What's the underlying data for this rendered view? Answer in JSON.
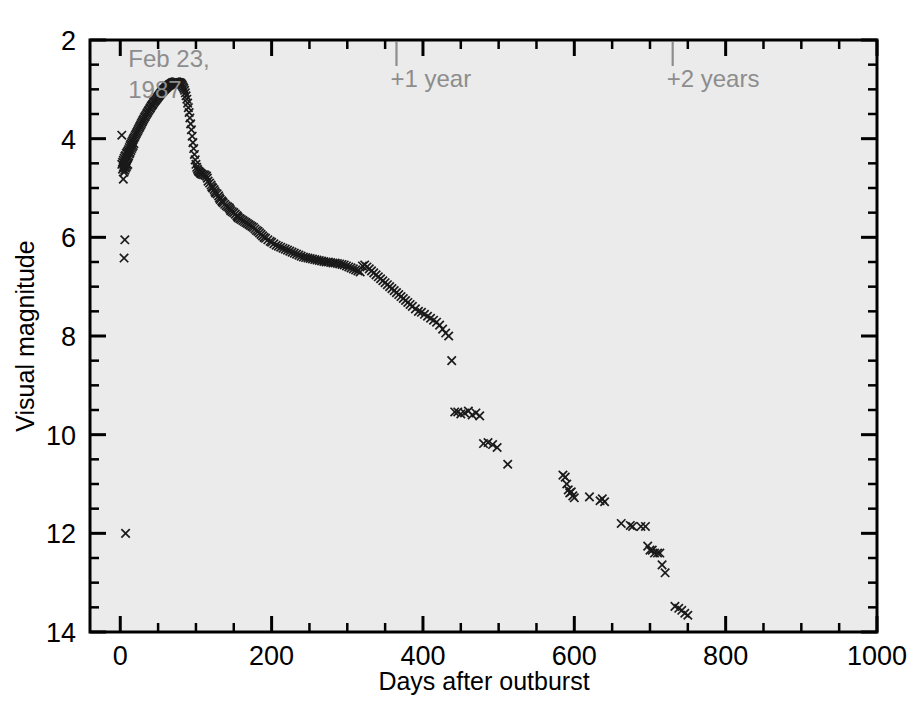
{
  "chart_data": {
    "type": "scatter",
    "title": "",
    "xlabel": "Days after outburst",
    "ylabel": "Visual magnitude",
    "xlim": [
      -40,
      1000
    ],
    "ylim": [
      2,
      14
    ],
    "y_inverted": true,
    "grid": false,
    "legend": null,
    "x_ticks_major": [
      0,
      200,
      400,
      600,
      800,
      1000
    ],
    "x_tick_labels": [
      "0",
      "200",
      "400",
      "600",
      "800",
      "1000"
    ],
    "x_ticks_minor_step": 50,
    "y_ticks_major": [
      2,
      4,
      6,
      8,
      10,
      12,
      14
    ],
    "y_tick_labels": [
      "2",
      "4",
      "6",
      "8",
      "10",
      "12",
      "14"
    ],
    "y_ticks_minor_step": 0.5,
    "marker_style": "x",
    "marker_color": "#1a1a1a",
    "plot_background": "#ebebeb",
    "annotations": [
      {
        "text": "Feb 23, 1987",
        "lines": [
          "Feb 23,",
          "1987"
        ],
        "x_day": 0,
        "y_mag": 2.55,
        "color": "#8d8d8d",
        "tick": false
      },
      {
        "text": "+1 year",
        "x_day": 365,
        "y_mag": 2.42,
        "color": "#8d8d8d",
        "tick": true
      },
      {
        "text": "+2 years",
        "x_day": 730,
        "y_mag": 2.42,
        "color": "#8d8d8d",
        "tick": true
      }
    ],
    "x": [
      2,
      3,
      3,
      4,
      4,
      5,
      5,
      5,
      6,
      6,
      6,
      7,
      7,
      7,
      8,
      8,
      8,
      9,
      9,
      9,
      10,
      10,
      10,
      11,
      11,
      2,
      4,
      6,
      5,
      7,
      12,
      12,
      13,
      13,
      14,
      14,
      15,
      15,
      16,
      16,
      17,
      17,
      18,
      18,
      19,
      20,
      21,
      22,
      23,
      24,
      25,
      26,
      27,
      28,
      29,
      30,
      31,
      32,
      33,
      34,
      35,
      36,
      37,
      38,
      39,
      40,
      41,
      42,
      43,
      44,
      45,
      46,
      47,
      48,
      49,
      50,
      51,
      52,
      53,
      54,
      55,
      56,
      57,
      58,
      59,
      60,
      61,
      62,
      63,
      64,
      65,
      66,
      67,
      68,
      69,
      70,
      71,
      72,
      73,
      74,
      75,
      76,
      77,
      78,
      79,
      80,
      81,
      82,
      83,
      84,
      85,
      86,
      87,
      88,
      89,
      90,
      91,
      92,
      93,
      94,
      95,
      96,
      97,
      98,
      99,
      100,
      101,
      102,
      103,
      104,
      105,
      106,
      107,
      108,
      110,
      112,
      114,
      115,
      116,
      118,
      120,
      121,
      122,
      124,
      125,
      126,
      128,
      130,
      131,
      132,
      134,
      135,
      136,
      138,
      140,
      142,
      144,
      145,
      146,
      148,
      150,
      152,
      154,
      155,
      156,
      158,
      160,
      162,
      164,
      166,
      168,
      170,
      172,
      174,
      176,
      178,
      180,
      182,
      184,
      186,
      188,
      190,
      192,
      195,
      198,
      200,
      203,
      206,
      209,
      212,
      215,
      218,
      221,
      224,
      227,
      230,
      233,
      236,
      239,
      242,
      245,
      248,
      251,
      254,
      257,
      260,
      263,
      266,
      269,
      272,
      275,
      278,
      281,
      284,
      287,
      290,
      293,
      296,
      299,
      302,
      305,
      308,
      311,
      314,
      317,
      320,
      323,
      326,
      329,
      332,
      335,
      338,
      341,
      344,
      347,
      350,
      353,
      356,
      359,
      362,
      365,
      368,
      371,
      374,
      377,
      380,
      383,
      386,
      390,
      394,
      398,
      402,
      406,
      410,
      414,
      418,
      422,
      426,
      430,
      434,
      438,
      442,
      446,
      450,
      455,
      460,
      465,
      470,
      475,
      480,
      486,
      492,
      498,
      512,
      585,
      588,
      590,
      592,
      594,
      596,
      598,
      600,
      620,
      634,
      637,
      640,
      662,
      674,
      677,
      688,
      694,
      697,
      700,
      703,
      706,
      710,
      713,
      716,
      720,
      733,
      738,
      742,
      746,
      750,
      768,
      778,
      784,
      790,
      798,
      805,
      818,
      832,
      916,
      920,
      924,
      928,
      932
    ],
    "y": [
      4.52,
      4.48,
      4.62,
      4.44,
      4.58,
      4.4,
      4.55,
      4.68,
      4.36,
      4.5,
      4.64,
      4.34,
      4.47,
      4.6,
      4.3,
      4.44,
      4.57,
      4.28,
      4.41,
      4.54,
      4.25,
      4.38,
      4.52,
      4.22,
      4.35,
      3.93,
      4.82,
      6.05,
      6.42,
      12.0,
      4.18,
      4.31,
      4.14,
      4.28,
      4.11,
      4.24,
      4.08,
      4.2,
      4.05,
      4.17,
      4.02,
      4.14,
      3.99,
      4.1,
      3.96,
      3.93,
      3.9,
      3.87,
      3.84,
      3.81,
      3.78,
      3.75,
      3.72,
      3.69,
      3.66,
      3.63,
      3.6,
      3.57,
      3.55,
      3.52,
      3.49,
      3.47,
      3.44,
      3.42,
      3.39,
      3.37,
      3.34,
      3.32,
      3.3,
      3.27,
      3.25,
      3.23,
      3.21,
      3.19,
      3.17,
      3.15,
      3.13,
      3.11,
      3.09,
      3.07,
      3.05,
      3.04,
      3.02,
      3.0,
      2.99,
      2.97,
      2.96,
      2.94,
      2.93,
      2.92,
      2.91,
      2.9,
      2.89,
      2.88,
      2.87,
      2.86,
      2.86,
      2.85,
      2.85,
      2.85,
      2.85,
      2.86,
      2.86,
      2.87,
      2.87,
      2.88,
      2.9,
      2.92,
      2.95,
      2.98,
      3.02,
      3.07,
      3.13,
      3.2,
      3.28,
      3.37,
      3.47,
      3.58,
      3.7,
      3.82,
      3.95,
      4.08,
      4.2,
      4.32,
      4.43,
      4.52,
      4.58,
      4.62,
      4.65,
      4.67,
      4.68,
      4.7,
      4.71,
      4.72,
      4.73,
      4.74,
      4.76,
      4.8,
      4.86,
      4.9,
      4.94,
      4.98,
      5.0,
      5.03,
      5.07,
      5.1,
      5.12,
      5.16,
      5.2,
      5.23,
      5.26,
      5.28,
      5.3,
      5.33,
      5.36,
      5.38,
      5.4,
      5.43,
      5.46,
      5.48,
      5.5,
      5.53,
      5.56,
      5.58,
      5.6,
      5.62,
      5.64,
      5.66,
      5.68,
      5.7,
      5.72,
      5.74,
      5.76,
      5.78,
      5.8,
      5.83,
      5.86,
      5.88,
      5.91,
      5.94,
      5.97,
      6.0,
      6.02,
      6.05,
      6.08,
      6.1,
      6.13,
      6.16,
      6.18,
      6.2,
      6.22,
      6.24,
      6.26,
      6.28,
      6.3,
      6.32,
      6.34,
      6.36,
      6.38,
      6.4,
      6.41,
      6.42,
      6.43,
      6.44,
      6.45,
      6.46,
      6.47,
      6.48,
      6.49,
      6.5,
      6.5,
      6.51,
      6.52,
      6.52,
      6.53,
      6.54,
      6.55,
      6.56,
      6.58,
      6.6,
      6.62,
      6.64,
      6.66,
      6.68,
      6.7,
      6.58,
      6.56,
      6.6,
      6.64,
      6.68,
      6.72,
      6.76,
      6.8,
      6.84,
      6.88,
      6.92,
      6.96,
      7.0,
      7.04,
      7.08,
      7.12,
      7.16,
      7.2,
      7.24,
      7.28,
      7.32,
      7.36,
      7.4,
      7.45,
      7.5,
      7.52,
      7.56,
      7.6,
      7.64,
      7.68,
      7.72,
      7.78,
      7.86,
      7.94,
      8.0,
      8.5,
      9.54,
      9.54,
      9.58,
      9.56,
      9.52,
      9.6,
      9.56,
      9.62,
      10.18,
      10.16,
      10.2,
      10.26,
      10.6,
      10.82,
      10.86,
      11.0,
      11.12,
      11.18,
      11.16,
      11.24,
      11.28,
      11.26,
      11.34,
      11.3,
      11.36,
      11.8,
      11.84,
      11.86,
      11.86,
      11.86,
      12.26,
      12.34,
      12.34,
      12.4,
      12.4,
      12.4,
      12.64,
      12.8,
      13.48,
      13.52,
      13.56,
      13.62,
      13.66
    ]
  }
}
